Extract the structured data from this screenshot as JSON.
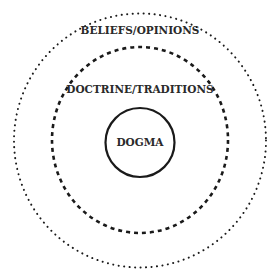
{
  "diagram": {
    "type": "concentric-circles",
    "layers": [
      {
        "id": "outer",
        "label": "BELIEFS/OPINIONS",
        "border_style": "dotted"
      },
      {
        "id": "middle",
        "label": "DOCTRINE/TRADITIONS",
        "border_style": "dashed"
      },
      {
        "id": "inner",
        "label": "DOGMA",
        "border_style": "solid"
      }
    ],
    "colors": {
      "background": "#ffffff",
      "stroke": "#1a1a1a",
      "text": "#2a2a2a"
    }
  }
}
